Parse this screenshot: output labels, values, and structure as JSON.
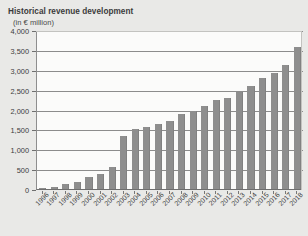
{
  "header": {
    "title": "Historical revenue development",
    "subtitle": "(in € million)"
  },
  "colors": {
    "bar": "#8e8e8e",
    "background": "#e9e9e7",
    "plot_background": "#fbfbfa",
    "gridline": "#8c8c8c",
    "text": "#3b3b3b"
  },
  "chart_data": {
    "type": "bar",
    "title": "Historical revenue development",
    "subtitle": "(in € million)",
    "xlabel": "",
    "ylabel": "in € million",
    "ylim": [
      0,
      4000
    ],
    "yticks": [
      "0",
      "500",
      "1,000",
      "1,500",
      "2,000",
      "2,500",
      "3,000",
      "3,500",
      "4,000"
    ],
    "ytick_values": [
      0,
      500,
      1000,
      1500,
      2000,
      2500,
      3000,
      3500,
      4000
    ],
    "grid": true,
    "legend": "none",
    "categories": [
      "1996",
      "1997",
      "1998",
      "1999",
      "2000",
      "2001",
      "2002",
      "2003",
      "2004",
      "2005",
      "2006",
      "2007",
      "2008",
      "2009",
      "2010",
      "2011",
      "2012",
      "2013",
      "2014",
      "2015",
      "2016",
      "2017",
      "2018"
    ],
    "values": [
      30,
      55,
      120,
      185,
      290,
      390,
      560,
      1330,
      1520,
      1570,
      1640,
      1700,
      1880,
      1960,
      2100,
      2230,
      2280,
      2430,
      2590,
      2800,
      2930,
      3130,
      3580
    ]
  }
}
